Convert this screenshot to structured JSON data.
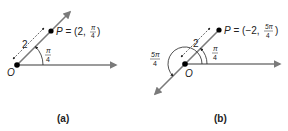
{
  "colors": {
    "ray": "#7a7a7a",
    "point": "#000000",
    "text": "#222222",
    "background": "#ffffff"
  },
  "panels": [
    {
      "id": "a",
      "caption": "(a)",
      "origin_label": "O",
      "point_label": "P = (2, π/4)",
      "point_label_parts": {
        "prefix": "P = (2, ",
        "num": "π",
        "den": "4",
        "suffix": ")"
      },
      "distance_label": "2",
      "angle_label": {
        "num": "π",
        "den": "4"
      }
    },
    {
      "id": "b",
      "caption": "(b)",
      "origin_label": "O",
      "point_label": "P = (−2, 5π/4)",
      "point_label_parts": {
        "prefix": "P = (−2, ",
        "num": "5π",
        "den": "4",
        "suffix": ")"
      },
      "distance_label": "2",
      "angle_label": {
        "num": "π",
        "den": "4"
      },
      "reflex_angle_label": {
        "num": "5π",
        "den": "4"
      }
    }
  ]
}
